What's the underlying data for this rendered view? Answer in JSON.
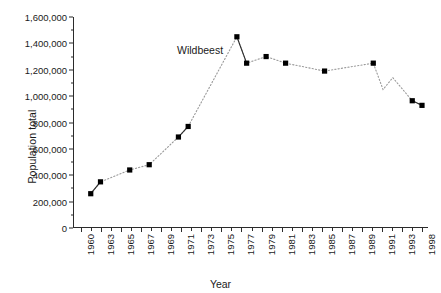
{
  "chart_data": {
    "type": "line",
    "title": "",
    "annotation": "Wildbeest",
    "xlabel": "Year",
    "ylabel": "Population total",
    "ylim": [
      0,
      1600000
    ],
    "ytick_values": [
      0,
      200000,
      400000,
      600000,
      800000,
      1000000,
      1200000,
      1400000,
      1600000
    ],
    "ytick_labels": [
      "0",
      "200,000",
      "400,000",
      "600,000",
      "800,000",
      "1,000,000",
      "1,200,000",
      "1,400,000",
      "1,600,000"
    ],
    "grid": false,
    "legend": "none",
    "marker_style": "filled-square",
    "line_style": "dotted",
    "xtick_labels": [
      "1960",
      "1963",
      "1965",
      "1967",
      "1969",
      "1971",
      "1973",
      "1975",
      "1977",
      "1979",
      "1981",
      "1983",
      "1985",
      "1987",
      "1989",
      "1991",
      "1993",
      "1998"
    ],
    "xtick_labels_every_other_tick": true,
    "x_categories": [
      "1960",
      "1961",
      "1963",
      "1964",
      "1965",
      "1966",
      "1967",
      "1968",
      "1969",
      "1970",
      "1971",
      "1972",
      "1973",
      "1974",
      "1975",
      "1976",
      "1977",
      "1978",
      "1979",
      "1980",
      "1981",
      "1982",
      "1983",
      "1984",
      "1985",
      "1986",
      "1987",
      "1988",
      "1989",
      "1990",
      "1991",
      "1992",
      "1993",
      "1994",
      "1995",
      "1998"
    ],
    "points": [
      {
        "x": "1961",
        "y": 260000,
        "marker": true
      },
      {
        "x": "1963",
        "y": 350000,
        "marker": true
      },
      {
        "x": "1966",
        "y": 440000,
        "marker": true
      },
      {
        "x": "1968",
        "y": 480000,
        "marker": true
      },
      {
        "x": "1971",
        "y": 690000,
        "marker": true
      },
      {
        "x": "1972",
        "y": 770000,
        "marker": true
      },
      {
        "x": "1977",
        "y": 1450000,
        "marker": true
      },
      {
        "x": "1978",
        "y": 1250000,
        "marker": true
      },
      {
        "x": "1980",
        "y": 1300000,
        "marker": true
      },
      {
        "x": "1982",
        "y": 1250000,
        "marker": true
      },
      {
        "x": "1986",
        "y": 1190000,
        "marker": true
      },
      {
        "x": "1991",
        "y": 1250000,
        "marker": true
      },
      {
        "x": "1992",
        "y": 1050000,
        "marker": false
      },
      {
        "x": "1993",
        "y": 1140000,
        "marker": false
      },
      {
        "x": "1995",
        "y": 965000,
        "marker": true
      },
      {
        "x": "1998",
        "y": 930000,
        "marker": true
      }
    ]
  },
  "colors": {
    "axis": "#2b2b2b",
    "marker": "#000000",
    "dotted_line": "#9a9a9a",
    "background": "#ffffff"
  }
}
